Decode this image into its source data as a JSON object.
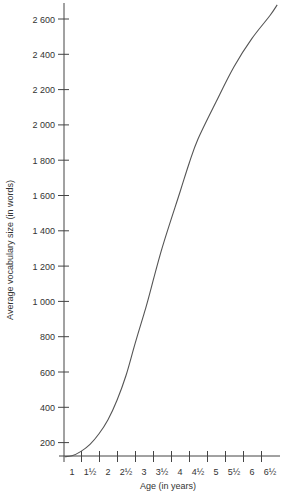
{
  "chart_data": {
    "type": "line",
    "title": "",
    "xlabel": "Age (in years)",
    "ylabel": "Average vocabulary size (in words)",
    "x_tick_labels": [
      "1",
      "1½",
      "2",
      "2½",
      "3",
      "3½",
      "4",
      "4½",
      "5",
      "5½",
      "6",
      "6½"
    ],
    "x_tick_values": [
      1,
      1.5,
      2,
      2.5,
      3,
      3.5,
      4,
      4.5,
      5,
      5.5,
      6,
      6.5
    ],
    "y_tick_labels": [
      "200",
      "400",
      "600",
      "800",
      "1 000",
      "1 200",
      "1 400",
      "1 600",
      "1 800",
      "2 000",
      "2 200",
      "2 400",
      "2 600"
    ],
    "y_tick_values": [
      200,
      400,
      600,
      800,
      1000,
      1200,
      1400,
      1600,
      1800,
      2000,
      2200,
      2400,
      2600
    ],
    "xlim": [
      0.75,
      6.75
    ],
    "ylim": [
      110,
      2690
    ],
    "grid": false,
    "legend": "none",
    "series": [
      {
        "name": "Average vocabulary size",
        "x": [
          0.8,
          1.0,
          1.25,
          1.5,
          1.75,
          2.0,
          2.25,
          2.5,
          2.75,
          3.0,
          3.1,
          3.5,
          4.0,
          4.25,
          4.5,
          5.0,
          5.5,
          6.0,
          6.5,
          6.7
        ],
        "y": [
          120,
          125,
          150,
          190,
          250,
          330,
          440,
          580,
          760,
          930,
          1000,
          1300,
          1620,
          1780,
          1920,
          2130,
          2330,
          2490,
          2620,
          2680
        ]
      }
    ],
    "line_color": "#555555",
    "axis_color": "#444444"
  }
}
